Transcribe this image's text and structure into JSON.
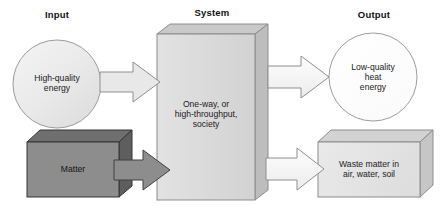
{
  "diagram": {
    "columns": [
      {
        "id": "input",
        "label": "Input"
      },
      {
        "id": "system",
        "label": "System"
      },
      {
        "id": "output",
        "label": "Output"
      }
    ],
    "nodes": [
      {
        "id": "high-quality-energy",
        "shape": "circle",
        "label": "High-quality\nenergy",
        "fill": "#ebebeb",
        "stroke": "#9a9a9a"
      },
      {
        "id": "matter",
        "shape": "cube",
        "label": "Matter",
        "fill": "#8d8d8d",
        "stroke": "#3a3a3a"
      },
      {
        "id": "system-society",
        "shape": "cube",
        "label": "One-way, or\nhigh-throughput,\nsociety",
        "fill": "#dcdcdc",
        "stroke": "#8f8f8f"
      },
      {
        "id": "low-quality-heat",
        "shape": "circle",
        "label": "Low-quality\nheat\nenergy",
        "fill": "#ffffff",
        "stroke": "#9a9a9a"
      },
      {
        "id": "waste-matter",
        "shape": "cube",
        "label": "Waste matter in\nair, water, soil",
        "fill": "#e4e4e4",
        "stroke": "#8f8f8f"
      }
    ],
    "arrows": [
      {
        "id": "energy-to-system",
        "from": "high-quality-energy",
        "to": "system-society",
        "style": "outline",
        "fill": "#e6e6e6",
        "stroke": "#8a8a8a"
      },
      {
        "id": "matter-to-system",
        "from": "matter",
        "to": "system-society",
        "style": "solid",
        "fill": "#8d8d8d",
        "stroke": "#3f3f3f"
      },
      {
        "id": "system-to-heat",
        "from": "system-society",
        "to": "low-quality-heat",
        "style": "outline",
        "fill": "#ffffff",
        "stroke": "#8a8a8a"
      },
      {
        "id": "system-to-waste",
        "from": "system-society",
        "to": "waste-matter",
        "style": "outline",
        "fill": "#f2f2f2",
        "stroke": "#8a8a8a"
      }
    ],
    "colors": {
      "background": "#ffffff",
      "text": "#1a1a1a",
      "dark_gray": "#8d8d8d",
      "light_gray": "#dcdcdc"
    }
  }
}
